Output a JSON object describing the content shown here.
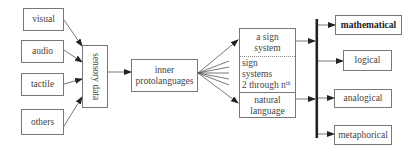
{
  "diagram": {
    "inputs": [
      {
        "label": "visual"
      },
      {
        "label": "audio"
      },
      {
        "label": "tactile"
      },
      {
        "label": "others"
      }
    ],
    "sensory": {
      "label": "sensory data"
    },
    "proto": {
      "line1": "inner",
      "line2": "protolanguages"
    },
    "sign_stack": {
      "top": {
        "line1": "a sign",
        "line2": "system"
      },
      "middle": {
        "line1": "sign",
        "line2": "systems",
        "line3": "2 through n",
        "sup": "th"
      },
      "bottom": {
        "line1": "natural",
        "line2": "language"
      }
    },
    "outputs": [
      {
        "label": "mathematical",
        "bold": true
      },
      {
        "label": "logical",
        "bold": false
      },
      {
        "label": "analogical",
        "bold": false
      },
      {
        "label": "metaphorical",
        "bold": false
      }
    ],
    "colors": {
      "line": "#555555",
      "bar": "#222222",
      "border": "#777777"
    }
  }
}
